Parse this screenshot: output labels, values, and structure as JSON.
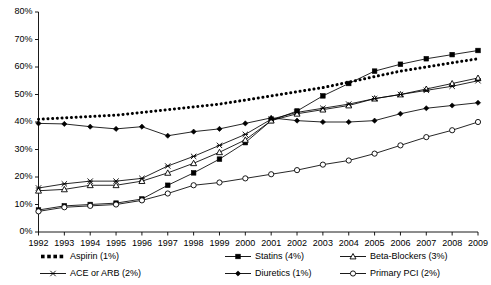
{
  "chart_data": {
    "type": "line",
    "title": "",
    "subtitle": "",
    "xlabel": "",
    "ylabel": "",
    "grid": false,
    "legend_position": "bottom",
    "xlim": [
      1992,
      2009
    ],
    "ylim": [
      0,
      80
    ],
    "ytick_values": [
      0,
      10,
      20,
      30,
      40,
      50,
      60,
      70,
      80
    ],
    "ytick_labels": [
      "0%",
      "10%",
      "20%",
      "30%",
      "40%",
      "50%",
      "60%",
      "70%",
      "80%"
    ],
    "categories": [
      1992,
      1993,
      1994,
      1995,
      1996,
      1997,
      1998,
      1999,
      2000,
      2001,
      2002,
      2003,
      2004,
      2005,
      2006,
      2007,
      2008,
      2009
    ],
    "xtick_labels": [
      "1992",
      "1993",
      "1994",
      "1995",
      "1996",
      "1997",
      "1998",
      "1999",
      "2000",
      "2001",
      "2002",
      "2003",
      "2004",
      "2005",
      "2006",
      "2007",
      "2008",
      "2009"
    ],
    "series": [
      {
        "name": "Aspirin (1%)",
        "legend_label": "Aspirin (1%)",
        "marker": "dotted-square",
        "line_style": "dotted",
        "color": "#000000",
        "values": [
          41.0,
          41.5,
          42.0,
          42.5,
          43.5,
          44.5,
          45.5,
          46.5,
          48.0,
          49.5,
          51.0,
          52.5,
          54.5,
          56.5,
          58.5,
          60.0,
          61.5,
          63.0
        ]
      },
      {
        "name": "Statins (4%)",
        "legend_label": "Statins (4%)",
        "marker": "filled-square",
        "line_style": "solid",
        "color": "#000000",
        "values": [
          8.0,
          9.5,
          10.0,
          10.5,
          12.0,
          17.0,
          21.5,
          26.5,
          32.5,
          40.5,
          44.0,
          49.5,
          54.0,
          58.5,
          61.0,
          63.0,
          64.5,
          66.0
        ]
      },
      {
        "name": "Beta-Blockers (3%)",
        "legend_label": "Beta-Blockers (3%)",
        "marker": "open-triangle",
        "line_style": "solid",
        "color": "#000000",
        "values": [
          15.0,
          15.5,
          17.0,
          17.0,
          18.5,
          21.5,
          25.0,
          29.0,
          33.5,
          40.5,
          43.0,
          44.5,
          46.0,
          48.5,
          50.0,
          52.0,
          54.0,
          56.0
        ]
      },
      {
        "name": "ACE or ARB (2%)",
        "legend_label": "ACE or ARB (2%)",
        "marker": "star-x",
        "line_style": "solid",
        "color": "#000000",
        "values": [
          16.0,
          17.5,
          18.5,
          18.5,
          19.5,
          24.0,
          27.5,
          31.5,
          35.5,
          41.0,
          43.5,
          45.0,
          46.5,
          48.5,
          50.0,
          51.5,
          53.0,
          55.0
        ]
      },
      {
        "name": "Diuretics (1%)",
        "legend_label": "Diuretics (1%)",
        "marker": "filled-diamond",
        "line_style": "solid",
        "color": "#000000",
        "values": [
          39.5,
          39.3,
          38.3,
          37.5,
          38.3,
          35.0,
          36.5,
          37.5,
          39.5,
          41.5,
          40.5,
          40.0,
          40.0,
          40.5,
          43.0,
          45.0,
          46.0,
          47.0
        ]
      },
      {
        "name": "Primary PCI (2%)",
        "legend_label": "Primary PCI (2%)",
        "marker": "open-circle",
        "line_style": "solid",
        "color": "#000000",
        "values": [
          7.5,
          9.0,
          9.5,
          10.0,
          11.5,
          14.0,
          17.0,
          18.0,
          19.5,
          21.0,
          22.5,
          24.5,
          26.0,
          28.5,
          31.5,
          34.5,
          37.0,
          40.0
        ]
      }
    ]
  },
  "legend": {
    "items": [
      {
        "label": "Aspirin (1%)",
        "marker": "dotted-square",
        "style": "dotted"
      },
      {
        "label": "Statins (4%)",
        "marker": "filled-square",
        "style": "solid"
      },
      {
        "label": "Beta-Blockers (3%)",
        "marker": "open-triangle",
        "style": "solid"
      },
      {
        "label": "ACE or ARB (2%)",
        "marker": "star-x",
        "style": "solid"
      },
      {
        "label": "Diuretics (1%)",
        "marker": "filled-diamond",
        "style": "solid"
      },
      {
        "label": "Primary PCI (2%)",
        "marker": "open-circle",
        "style": "solid"
      }
    ]
  }
}
